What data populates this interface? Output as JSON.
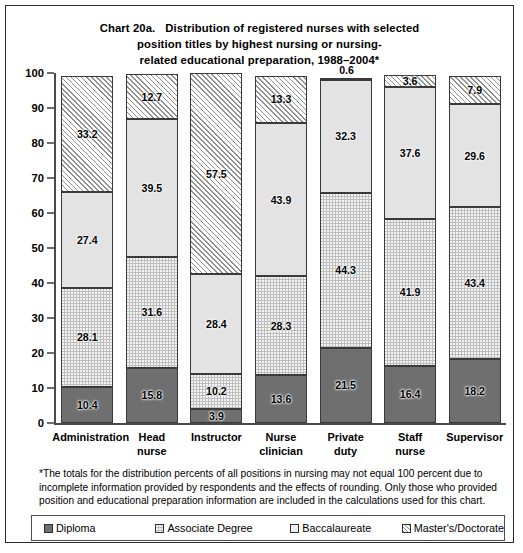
{
  "title": {
    "chart_number": "Chart 20a.",
    "line1": "Distribution of registered nurses with selected",
    "line2": "position titles by highest nursing or nursing-",
    "line3": "related educational preparation, 1988–2004*"
  },
  "footnote": "*The totals for the distribution percents of all positions in nursing may not equal 100 percent due to incomplete information provided by respondents and the effects of rounding. Only those who provided position and educational preparation information are included in the calculations used for this chart.",
  "legend": {
    "items": [
      {
        "label": "Diploma",
        "color": "#6f6f6f",
        "pattern": "solid-dark-gray"
      },
      {
        "label": "Associate Degree",
        "color": "#bdbdbd",
        "pattern": "dotted"
      },
      {
        "label": "Baccalaureate",
        "color": "#e3e3e3",
        "pattern": "solid-light-gray"
      },
      {
        "label": "Master's/Doctorate",
        "color": "#ffffff",
        "pattern": "diagonal-hatch"
      }
    ]
  },
  "chart_data": {
    "type": "bar",
    "subtype": "stacked-bar",
    "xlabel": "",
    "ylabel": "",
    "ylim": [
      0,
      100
    ],
    "yticks": [
      0,
      10,
      20,
      30,
      40,
      50,
      60,
      70,
      80,
      90,
      100
    ],
    "grid": false,
    "legend_position": "bottom",
    "categories": [
      "Administration",
      "Head nurse",
      "Instructor",
      "Nurse clinician",
      "Private duty",
      "Staff nurse",
      "Supervisor"
    ],
    "category_lines": [
      [
        "Administration"
      ],
      [
        "Head",
        "nurse"
      ],
      [
        "Instructor"
      ],
      [
        "Nurse",
        "clinician"
      ],
      [
        "Private",
        "duty"
      ],
      [
        "Staff",
        "nurse"
      ],
      [
        "Supervisor"
      ]
    ],
    "series": [
      {
        "name": "Diploma",
        "values": [
          10.4,
          15.8,
          3.9,
          13.6,
          21.5,
          16.4,
          18.2
        ]
      },
      {
        "name": "Associate Degree",
        "values": [
          28.1,
          31.6,
          10.2,
          28.3,
          44.3,
          41.9,
          43.4
        ]
      },
      {
        "name": "Baccalaureate",
        "values": [
          27.4,
          39.5,
          28.4,
          43.9,
          32.3,
          37.6,
          29.6
        ]
      },
      {
        "name": "Master's/Doctorate",
        "values": [
          33.2,
          12.7,
          57.5,
          13.3,
          0.6,
          3.6,
          7.9
        ]
      }
    ],
    "label_outside": [
      [
        false,
        false,
        false,
        false
      ],
      [
        false,
        false,
        false,
        false
      ],
      [
        false,
        false,
        false,
        false
      ],
      [
        false,
        false,
        false,
        false
      ],
      [
        false,
        false,
        false,
        true
      ],
      [
        false,
        false,
        false,
        false
      ],
      [
        false,
        false,
        false,
        false
      ]
    ]
  }
}
